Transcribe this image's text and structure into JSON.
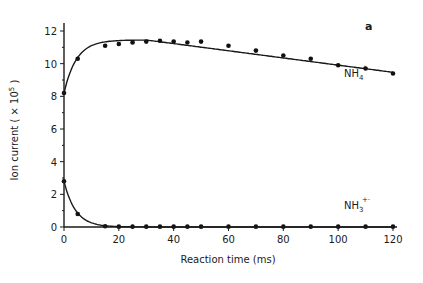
{
  "chart_data": {
    "type": "scatter",
    "panel_label": "a",
    "title": "",
    "xlabel": "Reaction time (ms)",
    "ylabel": "Ion current ( × 10⁵ )",
    "xlim": [
      0,
      120
    ],
    "ylim": [
      0,
      12
    ],
    "x_ticks": [
      0,
      20,
      40,
      60,
      80,
      100,
      120
    ],
    "y_ticks": [
      0,
      2,
      4,
      6,
      8,
      10,
      12
    ],
    "grid": false,
    "legend": "inline labels at right end of curves",
    "series": [
      {
        "name": "NH4+",
        "label_main": "NH",
        "label_sub": "4",
        "label_sup": "+",
        "x": [
          0,
          5,
          15,
          20,
          25,
          30,
          35,
          40,
          45,
          50,
          60,
          70,
          80,
          90,
          100,
          110,
          120
        ],
        "values": [
          8.2,
          10.3,
          11.1,
          11.2,
          11.3,
          11.35,
          11.4,
          11.35,
          11.3,
          11.35,
          11.1,
          10.8,
          10.5,
          10.3,
          9.9,
          9.7,
          9.4
        ],
        "fit_curve": true
      },
      {
        "name": "NH3+•",
        "label_main": "NH",
        "label_sub": "3",
        "label_sup": "+·",
        "x": [
          0,
          5,
          15,
          20,
          25,
          30,
          35,
          40,
          45,
          50,
          60,
          70,
          80,
          90,
          100,
          110,
          120
        ],
        "values": [
          2.8,
          0.8,
          0.05,
          0.02,
          0.02,
          0.02,
          0.02,
          0.02,
          0.02,
          0.02,
          0.02,
          0.02,
          0.02,
          0.02,
          0.02,
          0.02,
          0.02
        ],
        "fit_curve": true
      }
    ]
  }
}
